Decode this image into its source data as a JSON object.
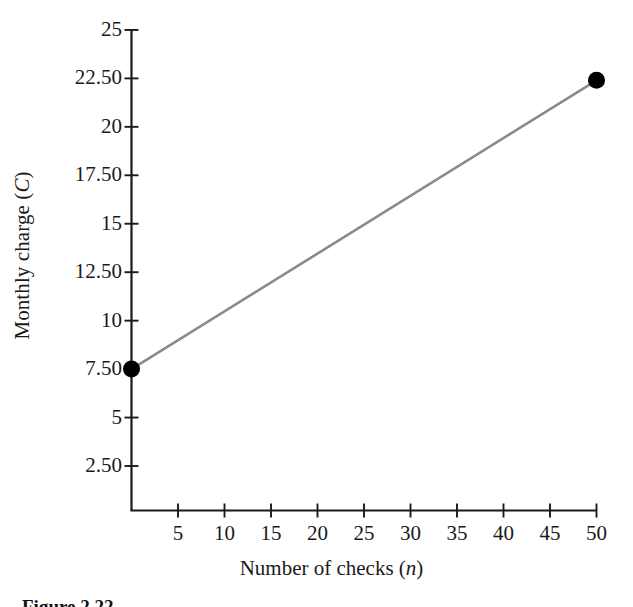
{
  "figure": {
    "caption": "Figure 2.22",
    "line_color": "#8a8a8a",
    "marker_color": "#000000",
    "axis_color": "#1a1a1a"
  },
  "chart_data": {
    "type": "line",
    "title": "",
    "subtitle": "",
    "xlabel": "Number of checks (n)",
    "xlabel_parts": {
      "text": "Number of checks (",
      "italic": "n",
      "tail": ")"
    },
    "ylabel": "Monthly charge (C)",
    "ylabel_parts": {
      "text": "Monthly charge (",
      "italic": "C",
      "tail": ")"
    },
    "xlim": [
      0,
      50
    ],
    "ylim": [
      0,
      25
    ],
    "xticks": [
      5,
      10,
      15,
      20,
      25,
      30,
      35,
      40,
      45,
      50
    ],
    "xticklabels": [
      "5",
      "10",
      "15",
      "20",
      "25",
      "30",
      "35",
      "40",
      "45",
      "50"
    ],
    "yticks": [
      2.5,
      5,
      7.5,
      10,
      12.5,
      15,
      17.5,
      20,
      22.5,
      25
    ],
    "yticklabels": [
      "2.50",
      "5",
      "7.50",
      "10",
      "12.50",
      "15",
      "17.50",
      "20",
      "22.50",
      "25"
    ],
    "grid": false,
    "legend": null,
    "legend_position": "none",
    "series": [
      {
        "name": "Monthly charge",
        "x": [
          0,
          50
        ],
        "y": [
          7.5,
          22.4
        ],
        "markers": [
          {
            "x": 0,
            "y": 7.5
          },
          {
            "x": 50,
            "y": 22.4
          }
        ]
      }
    ],
    "annotations": []
  }
}
